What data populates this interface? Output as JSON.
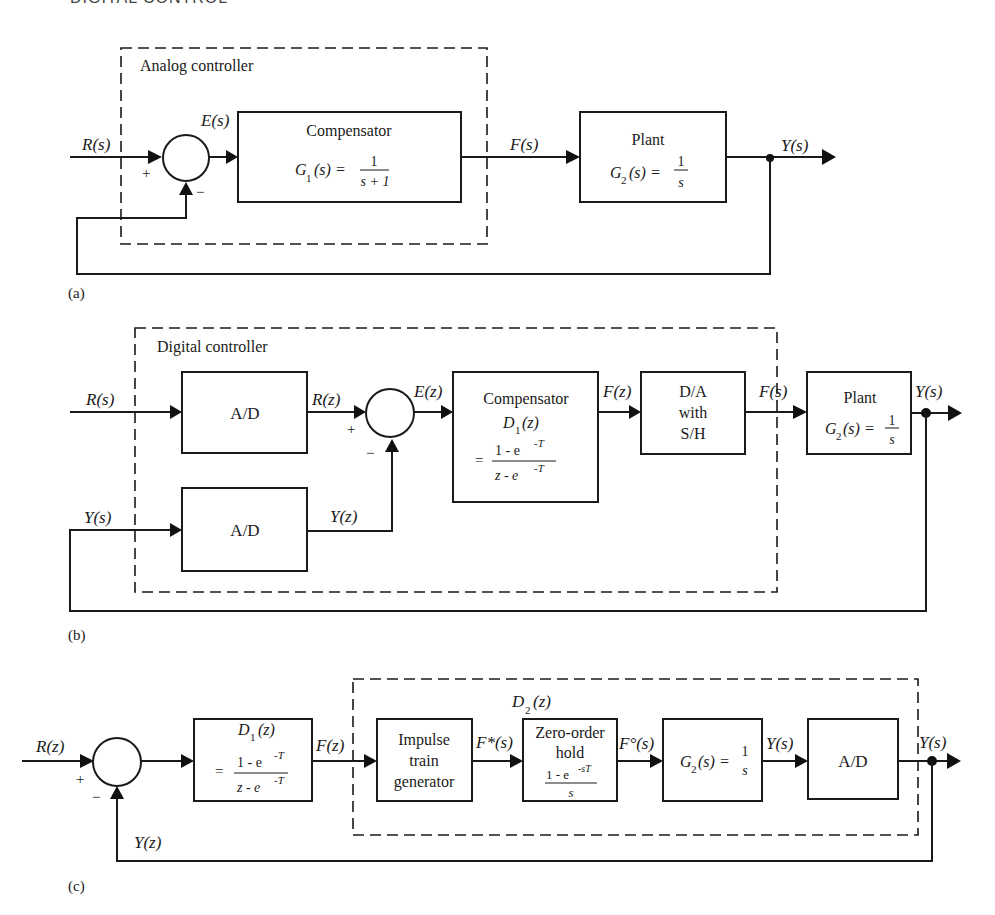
{
  "header": {
    "running_title": "DIGITAL CONTROL"
  },
  "panel_a": {
    "caption": "(a)",
    "group_label": "Analog controller",
    "input": "R(s)",
    "error": "E(s)",
    "plus": "+",
    "minus": "−",
    "compensator": {
      "title": "Compensator",
      "lhs": "G",
      "sub": "1",
      "arg": "(s) =",
      "num": "1",
      "den": "s + 1"
    },
    "signal_f": "F(s)",
    "plant": {
      "title": "Plant",
      "lhs": "G",
      "sub": "2",
      "arg": "(s) =",
      "num": "1",
      "den": "s"
    },
    "output": "Y(s)"
  },
  "panel_b": {
    "caption": "(b)",
    "group_label": "Digital controller",
    "input": "R(s)",
    "feedback_in": "Y(s)",
    "ad_top": "A/D",
    "ad_bottom": "A/D",
    "rz": "R(z)",
    "yz": "Y(z)",
    "plus": "+",
    "minus": "−",
    "error": "E(z)",
    "compensator": {
      "title": "Compensator",
      "lhs": "D",
      "sub": "1",
      "arg": "(z)",
      "eq": "=",
      "num": "1 - e",
      "num_exp": "-T",
      "den": "z - e",
      "den_exp": "-T"
    },
    "fz": "F(z)",
    "da": {
      "l1": "D/A",
      "l2": "with",
      "l3": "S/H"
    },
    "fs": "F(s)",
    "plant": {
      "title": "Plant",
      "lhs": "G",
      "sub": "2",
      "arg": "(s) =",
      "num": "1",
      "den": "s"
    },
    "output": "Y(s)"
  },
  "panel_c": {
    "caption": "(c)",
    "group_label": {
      "lhs": "D",
      "sub": "2",
      "arg": "(z)"
    },
    "input": "R(z)",
    "plus": "+",
    "minus": "−",
    "d1": {
      "lhs": "D",
      "sub": "1",
      "arg": "(z)",
      "eq": "=",
      "num": "1 - e",
      "num_exp": "-T",
      "den": "z - e",
      "den_exp": "-T"
    },
    "fz": "F(z)",
    "impulse": {
      "l1": "Impulse",
      "l2": "train",
      "l3": "generator"
    },
    "fstar": "F*(s)",
    "zoh": {
      "l1": "Zero-order",
      "l2": "hold",
      "num": "1 - e",
      "num_exp": "-sT",
      "den": "s"
    },
    "fcirc": "F°(s)",
    "g2": {
      "lhs": "G",
      "sub": "2",
      "arg": "(s) =",
      "num": "1",
      "den": "s"
    },
    "ys_mid": "Y(s)",
    "ad": "A/D",
    "output": "Y(s)",
    "feedback": "Y(z)"
  }
}
